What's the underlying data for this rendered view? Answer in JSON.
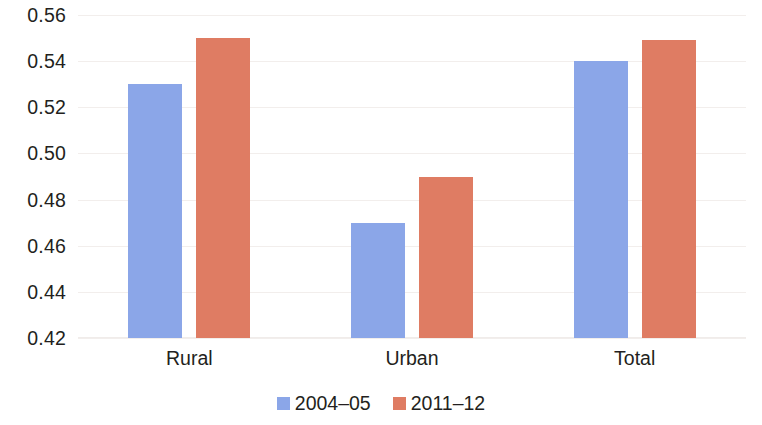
{
  "chart_data": {
    "type": "bar",
    "title": "",
    "subtitle": "",
    "xlabel": "",
    "ylabel": "",
    "categories": [
      "Rural",
      "Urban",
      "Total"
    ],
    "series": [
      {
        "name": "2004–05",
        "color": "#8ba6e8",
        "values": [
          0.53,
          0.47,
          0.54
        ]
      },
      {
        "name": "2011–12",
        "color": "#df7c63",
        "values": [
          0.55,
          0.49,
          0.549
        ]
      }
    ],
    "ylim": [
      0.42,
      0.56
    ],
    "yticks": [
      0.56,
      0.54,
      0.52,
      0.5,
      0.48,
      0.46,
      0.44,
      0.42
    ],
    "ytick_labels": [
      "0.56",
      "0.54",
      "0.52",
      "0.50",
      "0.48",
      "0.46",
      "0.44",
      "0.42"
    ],
    "grid": true,
    "grid_color": "#f2eeec",
    "legend_position": "bottom",
    "background": "#ffffff"
  }
}
